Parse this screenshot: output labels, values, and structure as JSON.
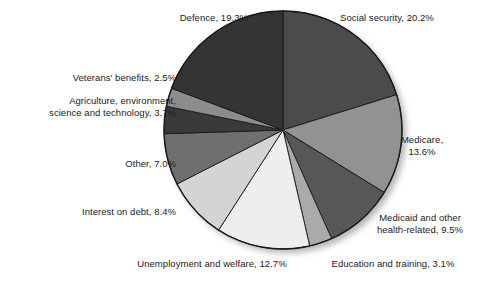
{
  "chart_data": {
    "type": "pie",
    "title": "",
    "subtitle": "",
    "xlabel": "",
    "ylabel": "",
    "legend_position": "none",
    "grid": false,
    "units": "percent",
    "start_angle_deg": 0,
    "direction": "clockwise",
    "categories": [
      "Social security",
      "Medicare",
      "Medicaid and other health-related",
      "Education and training",
      "Unemployment and welfare",
      "Interest on debt",
      "Other",
      "Agriculture, environment, science and technology",
      "Veterans' benefits",
      "Defence"
    ],
    "values": [
      20.2,
      13.6,
      9.5,
      3.1,
      12.7,
      8.4,
      7.0,
      3.7,
      2.5,
      19.3
    ],
    "colors": [
      "#4b4b4b",
      "#929292",
      "#575757",
      "#aaaaaa",
      "#eeeeee",
      "#d4d4d4",
      "#6f6f6f",
      "#3a3a3a",
      "#8c8c8c",
      "#343434"
    ],
    "slices": [
      {
        "label": "Social security",
        "value": 20.2,
        "color": "#4b4b4b",
        "value_text": "20.2%"
      },
      {
        "label": "Medicare",
        "value": 13.6,
        "color": "#929292",
        "value_text": "13.6%"
      },
      {
        "label": "Medicaid and other health-related",
        "value": 9.5,
        "color": "#575757",
        "value_text": "9.5%"
      },
      {
        "label": "Education and training",
        "value": 3.1,
        "color": "#aaaaaa",
        "value_text": "3.1%"
      },
      {
        "label": "Unemployment and welfare",
        "value": 12.7,
        "color": "#eeeeee",
        "value_text": "12.7%"
      },
      {
        "label": "Interest on debt",
        "value": 8.4,
        "color": "#d4d4d4",
        "value_text": "8.4%"
      },
      {
        "label": "Other",
        "value": 7.0,
        "color": "#6f6f6f",
        "value_text": "7.0%"
      },
      {
        "label": "Agriculture, environment, science and technology",
        "value": 3.7,
        "color": "#3a3a3a",
        "value_text": "3.7%"
      },
      {
        "label": "Veterans' benefits",
        "value": 2.5,
        "color": "#8c8c8c",
        "value_text": "2.5%"
      },
      {
        "label": "Defence",
        "value": 19.3,
        "color": "#343434",
        "value_text": "19.3%"
      }
    ]
  },
  "labels": {
    "defence": "Defence, 19.3%",
    "social_security": "Social security, 20.2%",
    "veterans": "Veterans' benefits, 2.5%",
    "agriculture": "Agriculture, environment,\nscience and technology, 3.7%",
    "medicare": "Medicare,\n13.6%",
    "other": "Other, 7.0%",
    "interest": "Interest on debt, 8.4%",
    "medicaid": "Medicaid and other\nhealth-related, 9.5%",
    "unemployment": "Unemployment and welfare, 12.7%",
    "education": "Education and training, 3.1%"
  },
  "geometry": {
    "center_x": 283,
    "center_y": 130,
    "radius": 119
  },
  "style": {
    "background": "#ffffff",
    "outline": "#1a1a1a",
    "text": "#1b1b1b",
    "shadow": "#b8b8b8"
  }
}
